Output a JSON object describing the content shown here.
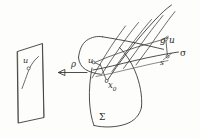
{
  "figure": {
    "kind": "hand-drawn-mathematical-diagram",
    "background_color": "#fdfdfc",
    "ink_color": "#3b3a38",
    "labels": {
      "u_plane": "u",
      "rho": "ρ",
      "u_surface": "u",
      "x_zero_base": "x",
      "x_zero_sub": "0",
      "sigma_capital": "Σ",
      "g_base": "g",
      "g_exponent": "s",
      "g_argument": "u",
      "s_point": "s",
      "sigma_small": "σ"
    }
  },
  "elements": {
    "plane": {
      "name": "local-chart-plane",
      "label": "u"
    },
    "arrow": {
      "name": "projection-arrow",
      "label": "ρ",
      "direction": "right-to-left"
    },
    "surface": {
      "name": "manifold-surface",
      "label": "Σ"
    },
    "transversal": {
      "name": "transversal-section",
      "label": "σ"
    },
    "flow_point": {
      "name": "flowed-point",
      "label": "g^s u"
    },
    "base_point": {
      "name": "base-point",
      "label": "x₀"
    },
    "arc_parameter": {
      "name": "arc-length-parameter",
      "label": "s"
    }
  }
}
